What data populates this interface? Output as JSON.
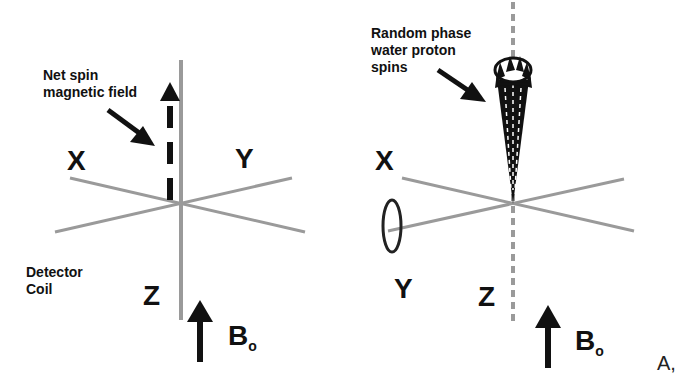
{
  "figure": {
    "panel_label": "A,",
    "left_panel": {
      "annotation_line1": "Net spin",
      "annotation_line2": "magnetic field",
      "axis_x": "X",
      "axis_y": "Y",
      "axis_z": "Z",
      "detector_line1": "Detector",
      "detector_line2": "Coil",
      "field_label": "B",
      "field_subscript": "o"
    },
    "right_panel": {
      "annotation_line1": "Random phase",
      "annotation_line2": "water proton",
      "annotation_line3": "spins",
      "axis_x": "X",
      "axis_y": "Y",
      "axis_z": "Z",
      "field_label": "B",
      "field_subscript": "o"
    },
    "colors": {
      "axis_gray": "#9a9a9a",
      "ink": "#111111",
      "background": "#ffffff"
    }
  }
}
